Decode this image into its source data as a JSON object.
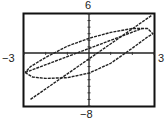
{
  "labels": {
    "ymax": "6",
    "ymin": "−8",
    "xmin": "−3",
    "xmax": "3"
  },
  "chart_data": {
    "type": "line",
    "title": "",
    "xlabel": "",
    "ylabel": "",
    "xlim": [
      -3,
      3
    ],
    "ylim": [
      -8,
      6
    ],
    "grid": false,
    "x_tick_step": 1,
    "y_tick_step": 1,
    "series": [
      {
        "name": "line",
        "points": [
          [
            -2.7,
            -7.0
          ],
          [
            2.9,
            5.8
          ]
        ]
      },
      {
        "name": "closed-loop (ellipse)",
        "points": [
          [
            -2.95,
            -2.9
          ],
          [
            -2.6,
            -3.6
          ],
          [
            -2.0,
            -3.8
          ],
          [
            -1.0,
            -3.7
          ],
          [
            0.0,
            -3.0
          ],
          [
            1.0,
            -1.5
          ],
          [
            2.0,
            0.8
          ],
          [
            2.7,
            2.5
          ],
          [
            2.95,
            3.0
          ],
          [
            2.7,
            3.8
          ],
          [
            2.0,
            3.8
          ],
          [
            1.0,
            3.2
          ],
          [
            0.0,
            2.3
          ],
          [
            -1.0,
            1.1
          ],
          [
            -2.0,
            -0.6
          ],
          [
            -2.7,
            -2.0
          ],
          [
            -2.95,
            -2.9
          ]
        ]
      },
      {
        "name": "diagonal through loop",
        "points": [
          [
            -2.95,
            -2.9
          ],
          [
            2.45,
            3.8
          ]
        ]
      }
    ]
  }
}
